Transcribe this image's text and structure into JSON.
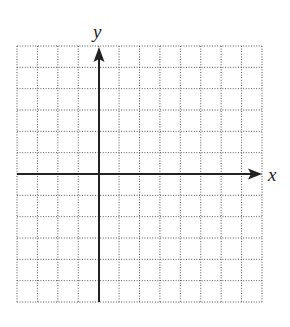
{
  "figure": {
    "type": "coordinate-plane",
    "x_axis_label": "x",
    "y_axis_label": "y",
    "grid": {
      "columns": 12,
      "rows": 12,
      "columns_left_of_y_axis": 4,
      "columns_right_of_y_axis": 8,
      "rows_above_x_axis": 6,
      "rows_below_x_axis": 6,
      "line_style": "dotted"
    },
    "x_axis_arrow": "right",
    "y_axis_arrow": "up",
    "colors": {
      "background": "#ffffff",
      "grid": "#555555",
      "axis": "#222222"
    }
  }
}
